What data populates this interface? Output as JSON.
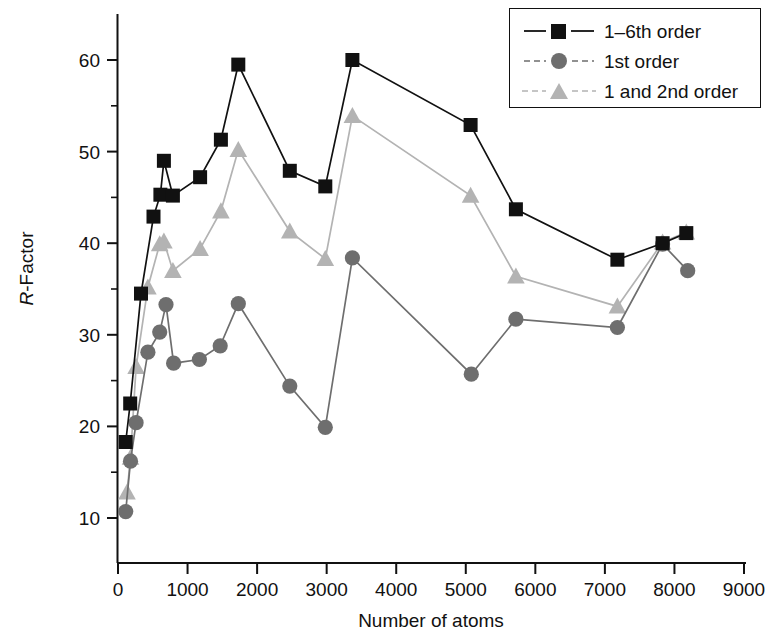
{
  "chart_data": {
    "type": "line",
    "title": "",
    "xlabel": "Number of atoms",
    "ylabel": "R-Factor",
    "ylabel_italic_prefix": "R",
    "ylabel_rest": "-Factor",
    "xlim": [
      0,
      9000
    ],
    "ylim": [
      5,
      64
    ],
    "x_ticks": [
      0,
      1000,
      2000,
      3000,
      4000,
      5000,
      6000,
      7000,
      8000,
      9000
    ],
    "x_tick_labels": [
      "0",
      "1000",
      "2000",
      "3000",
      "4000",
      "5000",
      "6000",
      "7000",
      "8000",
      "9000"
    ],
    "y_ticks": [
      10,
      20,
      30,
      40,
      50,
      60
    ],
    "y_tick_labels": [
      "10",
      "20",
      "30",
      "40",
      "50",
      "60"
    ],
    "y_minor_ticks": [
      15,
      25,
      35,
      45,
      55
    ],
    "grid": false,
    "legend_position": "top-right",
    "series": [
      {
        "name": "1–6th order",
        "marker": "square",
        "color": "#111111",
        "line_color": "#111111",
        "points": [
          {
            "x": 110,
            "y": 18.3
          },
          {
            "x": 175,
            "y": 22.5
          },
          {
            "x": 330,
            "y": 34.5
          },
          {
            "x": 510,
            "y": 42.9
          },
          {
            "x": 610,
            "y": 45.3
          },
          {
            "x": 660,
            "y": 49.0
          },
          {
            "x": 790,
            "y": 45.2
          },
          {
            "x": 1180,
            "y": 47.2
          },
          {
            "x": 1480,
            "y": 51.3
          },
          {
            "x": 1730,
            "y": 59.5
          },
          {
            "x": 2470,
            "y": 47.9
          },
          {
            "x": 2980,
            "y": 46.2
          },
          {
            "x": 3370,
            "y": 60.0
          },
          {
            "x": 5070,
            "y": 52.9
          },
          {
            "x": 5720,
            "y": 43.7
          },
          {
            "x": 7180,
            "y": 38.2
          },
          {
            "x": 7830,
            "y": 40.0
          },
          {
            "x": 8170,
            "y": 41.1
          }
        ]
      },
      {
        "name": "1st order",
        "marker": "circle",
        "color": "#6e6e6e",
        "line_color": "#6e6e6e",
        "points": [
          {
            "x": 110,
            "y": 10.7
          },
          {
            "x": 180,
            "y": 16.2
          },
          {
            "x": 260,
            "y": 20.4
          },
          {
            "x": 430,
            "y": 28.1
          },
          {
            "x": 600,
            "y": 30.3
          },
          {
            "x": 690,
            "y": 33.3
          },
          {
            "x": 800,
            "y": 26.9
          },
          {
            "x": 1170,
            "y": 27.3
          },
          {
            "x": 1470,
            "y": 28.8
          },
          {
            "x": 1730,
            "y": 33.4
          },
          {
            "x": 2470,
            "y": 24.4
          },
          {
            "x": 2980,
            "y": 19.9
          },
          {
            "x": 3370,
            "y": 38.4
          },
          {
            "x": 5080,
            "y": 25.7
          },
          {
            "x": 5720,
            "y": 31.7
          },
          {
            "x": 7180,
            "y": 30.8
          },
          {
            "x": 7830,
            "y": 39.9
          },
          {
            "x": 8190,
            "y": 37.0
          }
        ]
      },
      {
        "name": "1 and 2nd order",
        "marker": "triangle",
        "color": "#b3b3b3",
        "line_color": "#b3b3b3",
        "points": [
          {
            "x": 130,
            "y": 12.8
          },
          {
            "x": 180,
            "y": 16.6
          },
          {
            "x": 260,
            "y": 26.5
          },
          {
            "x": 430,
            "y": 35.2
          },
          {
            "x": 600,
            "y": 39.9
          },
          {
            "x": 660,
            "y": 40.2
          },
          {
            "x": 790,
            "y": 37.0
          },
          {
            "x": 1180,
            "y": 39.4
          },
          {
            "x": 1480,
            "y": 43.5
          },
          {
            "x": 1730,
            "y": 50.2
          },
          {
            "x": 2470,
            "y": 41.3
          },
          {
            "x": 2980,
            "y": 38.3
          },
          {
            "x": 3370,
            "y": 53.9
          },
          {
            "x": 5070,
            "y": 45.2
          },
          {
            "x": 5720,
            "y": 36.4
          },
          {
            "x": 7180,
            "y": 33.1
          },
          {
            "x": 7830,
            "y": 40.1
          },
          {
            "x": 8170,
            "y": 41.2
          }
        ]
      }
    ]
  },
  "legend": {
    "items": [
      {
        "label": "1–6th order",
        "marker": "square",
        "color": "#111111"
      },
      {
        "label": "1st order",
        "marker": "circle",
        "color": "#6e6e6e"
      },
      {
        "label": "1 and 2nd order",
        "marker": "triangle",
        "color": "#b3b3b3"
      }
    ]
  }
}
